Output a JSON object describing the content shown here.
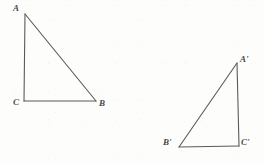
{
  "figure": {
    "type": "geometry-diagram",
    "background_color": "#fdfdfc",
    "stroke_color": "#5a5a5a",
    "label_color": "#4a4a4a",
    "stroke_width": 1.1,
    "canvas": {
      "width": 264,
      "height": 163
    },
    "shapes": [
      {
        "name": "triangle-abc",
        "vertices": [
          {
            "label": "A",
            "x": 25,
            "y": 14
          },
          {
            "label": "B",
            "x": 96,
            "y": 101
          },
          {
            "label": "C",
            "x": 24,
            "y": 101
          }
        ],
        "edges": [
          {
            "from": "A",
            "to": "B"
          },
          {
            "from": "A",
            "to": "C"
          },
          {
            "from": "C",
            "to": "B"
          }
        ]
      },
      {
        "name": "triangle-a-prime-b-prime-c-prime",
        "vertices": [
          {
            "label": "A'",
            "x": 237,
            "y": 63
          },
          {
            "label": "B'",
            "x": 179,
            "y": 147
          },
          {
            "label": "C'",
            "x": 239,
            "y": 146
          }
        ],
        "edges": [
          {
            "from": "A'",
            "to": "B'"
          },
          {
            "from": "A'",
            "to": "C'"
          },
          {
            "from": "B'",
            "to": "C'"
          }
        ]
      }
    ],
    "labels": [
      {
        "name": "label-a",
        "text": "A",
        "x": 13,
        "y": 4
      },
      {
        "name": "label-b",
        "text": "B",
        "x": 99,
        "y": 99
      },
      {
        "name": "label-c",
        "text": "C",
        "x": 13,
        "y": 98
      },
      {
        "name": "label-a-prime",
        "text": "A'",
        "x": 240,
        "y": 55
      },
      {
        "name": "label-b-prime",
        "text": "B'",
        "x": 163,
        "y": 138
      },
      {
        "name": "label-c-prime",
        "text": "C'",
        "x": 241,
        "y": 138
      }
    ]
  }
}
